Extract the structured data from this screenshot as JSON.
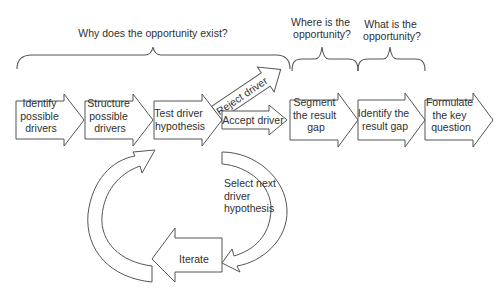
{
  "diagram": {
    "type": "process-flow",
    "headers": [
      {
        "id": "why",
        "lines": [
          "Why does the opportunity exist?"
        ]
      },
      {
        "id": "where",
        "lines": [
          "Where is the",
          "opportunity?"
        ]
      },
      {
        "id": "what",
        "lines": [
          "What is the",
          "opportunity?"
        ]
      }
    ],
    "steps": [
      {
        "id": "identify-drivers",
        "lines": [
          "Identify",
          "possible",
          "drivers"
        ]
      },
      {
        "id": "structure-drivers",
        "lines": [
          "Structure",
          "possible",
          "drivers"
        ]
      },
      {
        "id": "test-hypothesis",
        "lines": [
          "Test driver",
          "hypothesis"
        ]
      },
      {
        "id": "accept-driver",
        "lines": [
          "Accept driver"
        ]
      },
      {
        "id": "segment-gap",
        "lines": [
          "Segment",
          "the result",
          "gap"
        ]
      },
      {
        "id": "identify-gap",
        "lines": [
          "Identify the",
          "result gap"
        ]
      },
      {
        "id": "formulate-question",
        "lines": [
          "Formulate",
          "the key",
          "question"
        ]
      }
    ],
    "branch": {
      "id": "reject-driver",
      "lines": [
        "Reject driver"
      ]
    },
    "loop": {
      "select": {
        "lines": [
          "Select next",
          "driver",
          "hypothesis"
        ]
      },
      "iterate": {
        "lines": [
          "Iterate"
        ]
      }
    },
    "colors": {
      "stroke": "#555555",
      "fill": "#ffffff",
      "text": "#2f2f2f"
    }
  }
}
